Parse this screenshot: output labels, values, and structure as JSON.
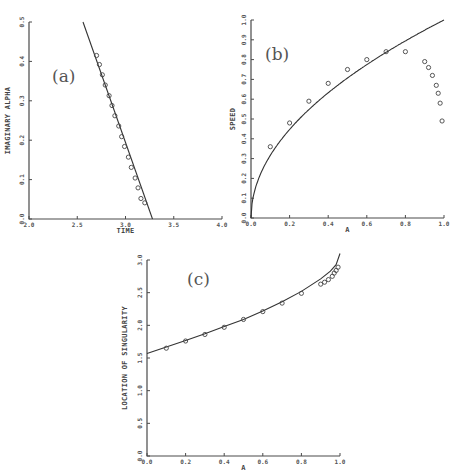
{
  "chart_data": [
    {
      "panel": "(a)",
      "type": "scatter",
      "title": "",
      "xlabel": "TIME",
      "ylabel": "IMAGINARY ALPHA",
      "xlim": [
        2.0,
        4.0
      ],
      "ylim": [
        0.0,
        0.5
      ],
      "xticks": [
        "2.0",
        "2.5",
        "3.0",
        "3.5",
        "4.0"
      ],
      "yticks": [
        "0.0",
        "0.1",
        "0.2",
        "0.3",
        "0.4",
        "0.5"
      ],
      "grid": false,
      "series": [
        {
          "name": "theory",
          "kind": "line",
          "x": [
            2.56,
            3.28
          ],
          "y": [
            0.5,
            0.0
          ]
        },
        {
          "name": "numerical",
          "kind": "markers",
          "x": [
            2.7,
            2.73,
            2.76,
            2.79,
            2.83,
            2.86,
            2.89,
            2.93,
            2.96,
            2.99,
            3.03,
            3.06,
            3.1,
            3.13,
            3.16,
            3.2
          ],
          "y": [
            0.415,
            0.392,
            0.366,
            0.34,
            0.313,
            0.288,
            0.262,
            0.236,
            0.209,
            0.184,
            0.157,
            0.131,
            0.104,
            0.079,
            0.052,
            0.041
          ]
        }
      ]
    },
    {
      "panel": "(b)",
      "type": "scatter",
      "title": "",
      "xlabel": "A",
      "ylabel": "SPEED",
      "xlim": [
        0.0,
        1.0
      ],
      "ylim": [
        0.0,
        1.0
      ],
      "xticks": [
        "0.0",
        "0.2",
        "0.4",
        "0.6",
        "0.8",
        "1.0"
      ],
      "yticks": [
        "0.0",
        "0.1",
        "0.2",
        "0.3",
        "0.4",
        "0.5",
        "0.6",
        "0.7",
        "0.8",
        "0.9",
        "1.0"
      ],
      "grid": false,
      "series": [
        {
          "name": "theory",
          "kind": "line",
          "function": "sqrt(A)",
          "x": [
            0.0,
            0.01,
            0.05,
            0.1,
            0.2,
            0.3,
            0.4,
            0.5,
            0.6,
            0.7,
            0.8,
            0.9,
            1.0
          ],
          "y": [
            0.0,
            0.1,
            0.224,
            0.316,
            0.447,
            0.548,
            0.632,
            0.707,
            0.775,
            0.837,
            0.894,
            0.949,
            1.0
          ]
        },
        {
          "name": "numerical",
          "kind": "markers",
          "x": [
            0.1,
            0.2,
            0.3,
            0.4,
            0.5,
            0.6,
            0.7,
            0.8,
            0.9,
            0.92,
            0.94,
            0.96,
            0.97,
            0.98,
            0.99
          ],
          "y": [
            0.36,
            0.48,
            0.59,
            0.68,
            0.75,
            0.8,
            0.84,
            0.84,
            0.79,
            0.76,
            0.72,
            0.67,
            0.63,
            0.58,
            0.49
          ]
        }
      ]
    },
    {
      "panel": "(c)",
      "type": "scatter",
      "title": "",
      "xlabel": "A",
      "ylabel": "LOCATION OF SINGULARITY",
      "xlim": [
        0.0,
        1.0
      ],
      "ylim": [
        0.0,
        3.0
      ],
      "xticks": [
        "0.0",
        "0.2",
        "0.4",
        "0.6",
        "0.8",
        "1.0"
      ],
      "yticks": [
        "0.0",
        "0.5",
        "1.0",
        "1.5",
        "2.0",
        "2.5",
        "3.0"
      ],
      "grid": false,
      "series": [
        {
          "name": "theory",
          "kind": "line",
          "x": [
            0.0,
            0.1,
            0.2,
            0.3,
            0.4,
            0.5,
            0.6,
            0.7,
            0.8,
            0.9,
            0.95,
            0.98,
            1.0
          ],
          "y": [
            1.57,
            1.67,
            1.77,
            1.87,
            1.98,
            2.09,
            2.22,
            2.36,
            2.52,
            2.71,
            2.83,
            2.93,
            3.1
          ]
        },
        {
          "name": "numerical",
          "kind": "markers",
          "x": [
            0.1,
            0.2,
            0.3,
            0.4,
            0.5,
            0.6,
            0.7,
            0.8,
            0.9,
            0.92,
            0.94,
            0.96,
            0.97,
            0.98,
            0.99
          ],
          "y": [
            1.65,
            1.76,
            1.86,
            1.97,
            2.09,
            2.21,
            2.34,
            2.49,
            2.63,
            2.66,
            2.7,
            2.75,
            2.8,
            2.84,
            2.89
          ]
        }
      ]
    }
  ]
}
